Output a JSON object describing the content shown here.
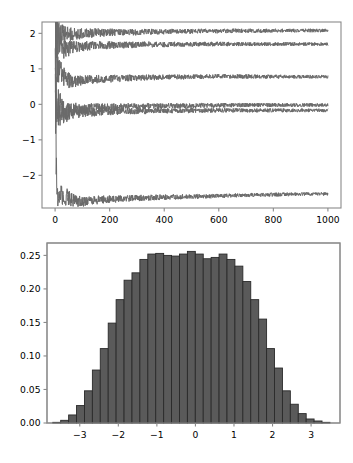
{
  "figure": {
    "width": 353,
    "height": 463,
    "background": "#ffffff"
  },
  "chart_data": [
    {
      "id": "running-mean-convergence",
      "type": "line",
      "title": "",
      "subtitle": "",
      "xlabel": "",
      "ylabel": "",
      "xlim": [
        -48,
        1048
      ],
      "ylim": [
        -2.92,
        2.32
      ],
      "xticks": [
        0,
        200,
        400,
        600,
        800,
        1000
      ],
      "xticklabels": [
        "0",
        "200",
        "400",
        "600",
        "800",
        "1000"
      ],
      "yticks": [
        -2,
        -1,
        0,
        1,
        2
      ],
      "yticklabels": [
        "-2",
        "-1",
        "0",
        "1",
        "2"
      ],
      "grid": false,
      "legend": null,
      "legend_position": "none",
      "line_color": "#6a6a6a",
      "line_width": 1.0,
      "n_series": 6,
      "x_sample": [
        1,
        2,
        3,
        4,
        5,
        6,
        8,
        10,
        12,
        15,
        18,
        22,
        26,
        30,
        35,
        40,
        46,
        52,
        60,
        70,
        80,
        95,
        110,
        130,
        150,
        175,
        200,
        230,
        260,
        300,
        340,
        380,
        430,
        480,
        540,
        600,
        670,
        740,
        820,
        900,
        1000
      ],
      "series": [
        {
          "name": "series-1",
          "converged_value": 2.08,
          "values": [
            2.22,
            1.6,
            2.1,
            1.88,
            2.12,
            1.96,
            2.04,
            1.92,
            2.0,
            1.95,
            1.99,
            1.97,
            1.94,
            1.96,
            1.95,
            1.97,
            1.96,
            1.98,
            1.97,
            1.99,
            2.0,
            1.99,
            2.01,
            2.0,
            2.02,
            2.01,
            2.03,
            2.02,
            2.04,
            2.03,
            2.05,
            2.04,
            2.06,
            2.05,
            2.07,
            2.06,
            2.08,
            2.07,
            2.08,
            2.08,
            2.08
          ]
        },
        {
          "name": "series-2",
          "converged_value": 1.7,
          "values": [
            2.3,
            1.2,
            2.05,
            1.55,
            1.92,
            1.72,
            1.86,
            1.74,
            1.82,
            1.7,
            1.78,
            1.68,
            1.6,
            1.55,
            1.58,
            1.56,
            1.54,
            1.58,
            1.6,
            1.62,
            1.61,
            1.63,
            1.64,
            1.65,
            1.66,
            1.65,
            1.67,
            1.66,
            1.68,
            1.67,
            1.69,
            1.68,
            1.69,
            1.69,
            1.7,
            1.7,
            1.7,
            1.7,
            1.7,
            1.7,
            1.7
          ]
        },
        {
          "name": "series-3",
          "converged_value": 0.78,
          "values": [
            1.95,
            0.45,
            1.25,
            0.7,
            1.05,
            0.8,
            0.98,
            0.86,
            0.95,
            0.88,
            0.93,
            0.86,
            0.82,
            0.78,
            0.75,
            0.72,
            0.7,
            0.67,
            0.65,
            0.64,
            0.65,
            0.67,
            0.68,
            0.7,
            0.71,
            0.72,
            0.72,
            0.73,
            0.74,
            0.75,
            0.76,
            0.76,
            0.77,
            0.77,
            0.78,
            0.79,
            0.79,
            0.78,
            0.78,
            0.78,
            0.78
          ]
        },
        {
          "name": "series-4",
          "converged_value": -0.02,
          "values": [
            0.3,
            -0.4,
            0.18,
            -0.25,
            0.1,
            -0.18,
            0.05,
            -0.12,
            0.02,
            -0.09,
            0.0,
            -0.07,
            -0.12,
            -0.15,
            -0.17,
            -0.19,
            -0.18,
            -0.16,
            -0.15,
            -0.14,
            -0.13,
            -0.12,
            -0.11,
            -0.1,
            -0.09,
            -0.09,
            -0.08,
            -0.07,
            -0.06,
            -0.06,
            -0.05,
            -0.05,
            -0.04,
            -0.04,
            -0.03,
            -0.03,
            -0.02,
            -0.02,
            -0.02,
            -0.02,
            -0.02
          ]
        },
        {
          "name": "series-5",
          "converged_value": -0.17,
          "values": [
            0.1,
            -0.62,
            -0.05,
            -0.45,
            -0.12,
            -0.38,
            -0.18,
            -0.32,
            -0.22,
            -0.29,
            -0.24,
            -0.28,
            -0.3,
            -0.31,
            -0.29,
            -0.28,
            -0.27,
            -0.26,
            -0.25,
            -0.24,
            -0.23,
            -0.23,
            -0.22,
            -0.22,
            -0.21,
            -0.21,
            -0.2,
            -0.2,
            -0.19,
            -0.19,
            -0.19,
            -0.18,
            -0.18,
            -0.18,
            -0.17,
            -0.17,
            -0.17,
            -0.17,
            -0.17,
            -0.17,
            -0.17
          ]
        },
        {
          "name": "series-6",
          "converged_value": -2.52,
          "values": [
            1.1,
            0.4,
            -0.55,
            -1.3,
            -1.9,
            -2.25,
            -2.45,
            -2.52,
            -2.48,
            -2.55,
            -2.5,
            -2.58,
            -2.54,
            -2.6,
            -2.56,
            -2.62,
            -2.58,
            -2.65,
            -2.68,
            -2.7,
            -2.72,
            -2.74,
            -2.73,
            -2.71,
            -2.7,
            -2.68,
            -2.67,
            -2.66,
            -2.65,
            -2.64,
            -2.63,
            -2.62,
            -2.61,
            -2.6,
            -2.59,
            -2.58,
            -2.56,
            -2.55,
            -2.54,
            -2.53,
            -2.52
          ]
        }
      ]
    },
    {
      "id": "normal-histogram",
      "type": "bar",
      "title": "",
      "subtitle": "",
      "xlabel": "",
      "ylabel": "",
      "xlim": [
        -3.85,
        3.75
      ],
      "ylim": [
        0.0,
        0.2685
      ],
      "xticks": [
        -3,
        -2,
        -1,
        0,
        1,
        2,
        3
      ],
      "xticklabels": [
        "-3",
        "-2",
        "-1",
        "0",
        "1",
        "2",
        "3"
      ],
      "yticks": [
        0.0,
        0.05,
        0.1,
        0.15,
        0.2,
        0.25
      ],
      "yticklabels": [
        "0.00",
        "0.05",
        "0.10",
        "0.15",
        "0.20",
        "0.25"
      ],
      "grid": false,
      "legend": null,
      "legend_position": "none",
      "bar_color": "#5a5a5a",
      "bar_edge_color": "#2a2a2a",
      "bin_width": 0.2054,
      "bin_edges": [
        -3.7,
        -3.495,
        -3.289,
        -3.084,
        -2.878,
        -2.673,
        -2.468,
        -2.262,
        -2.057,
        -1.851,
        -1.646,
        -1.441,
        -1.235,
        -1.03,
        -0.824,
        -0.619,
        -0.414,
        -0.208,
        -0.003,
        0.203,
        0.408,
        0.614,
        0.819,
        1.024,
        1.23,
        1.435,
        1.641,
        1.846,
        2.051,
        2.257,
        2.462,
        2.668,
        2.873,
        3.078,
        3.284,
        3.489,
        3.695
      ],
      "categories": [
        "-3.60",
        "-3.39",
        "-3.19",
        "-2.98",
        "-2.78",
        "-2.57",
        "-2.37",
        "-2.16",
        "-1.95",
        "-1.75",
        "-1.54",
        "-1.34",
        "-1.13",
        "-0.93",
        "-0.72",
        "-0.52",
        "-0.31",
        "-0.11",
        "0.10",
        "0.31",
        "0.51",
        "0.72",
        "0.92",
        "1.13",
        "1.33",
        "1.54",
        "1.74",
        "1.95",
        "2.15",
        "2.36",
        "2.57",
        "2.77",
        "2.98",
        "3.18",
        "3.39",
        "3.59"
      ],
      "values": [
        0.001,
        0.004,
        0.012,
        0.026,
        0.048,
        0.079,
        0.111,
        0.149,
        0.184,
        0.213,
        0.224,
        0.244,
        0.252,
        0.253,
        0.25,
        0.249,
        0.252,
        0.256,
        0.252,
        0.245,
        0.247,
        0.252,
        0.244,
        0.234,
        0.211,
        0.184,
        0.155,
        0.111,
        0.082,
        0.048,
        0.028,
        0.014,
        0.006,
        0.003,
        0.001,
        0.0
      ]
    }
  ]
}
